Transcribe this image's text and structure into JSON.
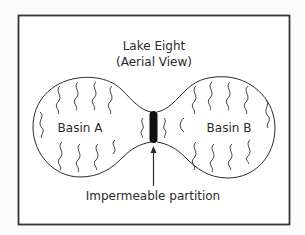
{
  "title": {
    "line1": "Lake Eight",
    "line2": "(Aerial View)"
  },
  "basins": [
    {
      "label": "Basin A"
    },
    {
      "label": "Basin B"
    }
  ],
  "partition": {
    "label": "Impermeable partition"
  },
  "colors": {
    "stroke": "#2a2a2a",
    "background": "#fbfbfb",
    "frame": "#333333"
  }
}
